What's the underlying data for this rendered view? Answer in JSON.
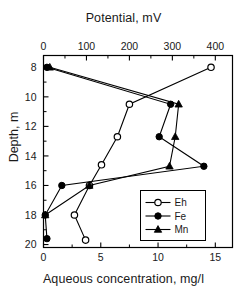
{
  "chart_data": {
    "type": "line",
    "title": "",
    "top_axis": {
      "label": "Potential, mV",
      "ticks": [
        0,
        100,
        200,
        300,
        400
      ],
      "range": [
        0,
        440
      ],
      "minor_ticks": true
    },
    "bottom_axis": {
      "label": "Aqueous concentration, mg/l",
      "ticks": [
        0,
        5,
        10,
        15
      ],
      "range": [
        0,
        16.5
      ],
      "minor_ticks": true
    },
    "y_axis": {
      "label": "Depth, m",
      "ticks": [
        8,
        10,
        12,
        14,
        16,
        18,
        20
      ],
      "range": [
        7.2,
        20.2
      ],
      "inverted": true,
      "minor_ticks": true
    },
    "grid": false,
    "legend_position": "bottom-right",
    "series": [
      {
        "name": "Eh",
        "marker": "open-circle",
        "axis": "top",
        "units": "mV",
        "points": [
          {
            "depth": 8.0,
            "value": 390
          },
          {
            "depth": 10.5,
            "value": 200
          },
          {
            "depth": 12.7,
            "value": 172
          },
          {
            "depth": 14.6,
            "value": 135
          },
          {
            "depth": 16.0,
            "value": 107
          },
          {
            "depth": 18.0,
            "value": 72
          },
          {
            "depth": 19.7,
            "value": 98
          }
        ]
      },
      {
        "name": "Fe",
        "marker": "filled-circle",
        "axis": "bottom",
        "units": "mg/l",
        "points": [
          {
            "depth": 8.0,
            "value": 0.3
          },
          {
            "depth": 10.5,
            "value": 11.1
          },
          {
            "depth": 12.7,
            "value": 10.1
          },
          {
            "depth": 14.7,
            "value": 14.0
          },
          {
            "depth": 16.0,
            "value": 1.6
          },
          {
            "depth": 18.0,
            "value": 0.15
          },
          {
            "depth": 19.6,
            "value": 0.3
          }
        ]
      },
      {
        "name": "Mn",
        "marker": "filled-triangle",
        "axis": "bottom",
        "units": "mg/l",
        "points": [
          {
            "depth": 8.0,
            "value": 0.55
          },
          {
            "depth": 10.5,
            "value": 11.8
          },
          {
            "depth": 12.7,
            "value": 11.5
          },
          {
            "depth": 14.7,
            "value": 11.0
          },
          {
            "depth": 16.0,
            "value": 4.0
          },
          {
            "depth": 18.0,
            "value": 0.15
          }
        ]
      }
    ],
    "legend": [
      {
        "label": "Eh",
        "marker": "open-circle"
      },
      {
        "label": "Fe",
        "marker": "filled-circle"
      },
      {
        "label": "Mn",
        "marker": "filled-triangle"
      }
    ],
    "colors": {
      "line": "#000000",
      "marker_fill": "#000000",
      "marker_open_fill": "#ffffff",
      "axis": "#000000",
      "background": "#ffffff"
    }
  }
}
